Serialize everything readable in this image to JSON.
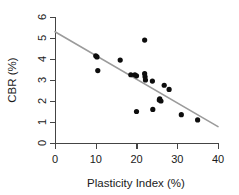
{
  "chart_data": {
    "type": "scatter",
    "title": "",
    "xlabel": "Plasticity Index (%)",
    "ylabel": "CBR (%)",
    "xlim": [
      0,
      40
    ],
    "ylim": [
      0,
      6
    ],
    "xticks": [
      0,
      10,
      20,
      30,
      40
    ],
    "yticks": [
      0,
      1,
      2,
      3,
      4,
      5,
      6
    ],
    "xtick_labels": [
      "0",
      "10",
      "20",
      "30",
      "40"
    ],
    "ytick_labels": [
      "0",
      "1",
      "2",
      "3",
      "4",
      "5",
      "6"
    ],
    "grid": false,
    "legend": false,
    "legend_position": "none",
    "point_color": "#0d0d0d",
    "line_color": "#9b9b9b",
    "axis_color": "#444444",
    "points": [
      {
        "x": 10.0,
        "y": 4.15
      },
      {
        "x": 10.3,
        "y": 4.1
      },
      {
        "x": 10.5,
        "y": 3.45
      },
      {
        "x": 16.0,
        "y": 3.95
      },
      {
        "x": 18.6,
        "y": 3.25
      },
      {
        "x": 19.6,
        "y": 3.25
      },
      {
        "x": 20.0,
        "y": 3.2
      },
      {
        "x": 20.0,
        "y": 1.5
      },
      {
        "x": 22.0,
        "y": 4.9
      },
      {
        "x": 22.0,
        "y": 3.3
      },
      {
        "x": 22.1,
        "y": 3.15
      },
      {
        "x": 22.2,
        "y": 3.0
      },
      {
        "x": 23.9,
        "y": 2.95
      },
      {
        "x": 24.0,
        "y": 1.6
      },
      {
        "x": 25.6,
        "y": 2.05
      },
      {
        "x": 25.7,
        "y": 2.1
      },
      {
        "x": 26.0,
        "y": 2.0
      },
      {
        "x": 26.8,
        "y": 2.75
      },
      {
        "x": 28.0,
        "y": 2.55
      },
      {
        "x": 31.0,
        "y": 1.35
      },
      {
        "x": 35.0,
        "y": 1.1
      }
    ],
    "fit_line": {
      "name": "linear trend",
      "x_start": 0,
      "y_start": 5.3,
      "x_end": 40,
      "y_end": 0.78,
      "slope": -0.113,
      "intercept": 5.3
    }
  }
}
